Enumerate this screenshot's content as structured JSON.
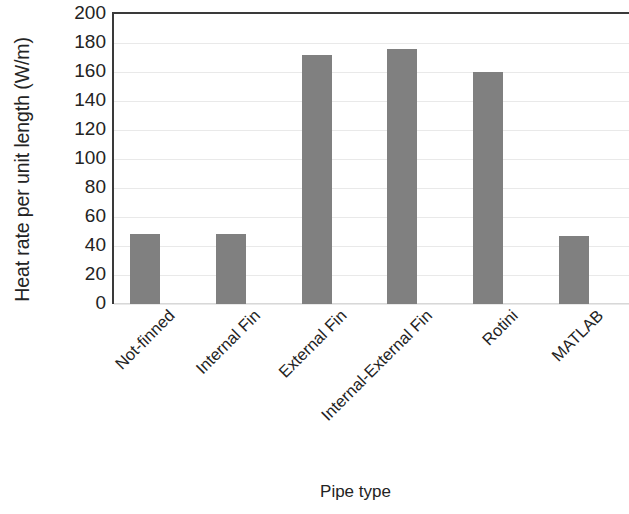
{
  "chart_data": {
    "type": "bar",
    "title": "",
    "xlabel": "Pipe type",
    "ylabel": "Heat rate per unit length (W/m)",
    "categories": [
      "Not-finned",
      "Internal Fin",
      "External Fin",
      "Internal-External Fin",
      "Rotini",
      "MATLAB"
    ],
    "values": [
      48,
      48,
      172,
      176,
      160,
      47
    ],
    "ylim": [
      0,
      200
    ],
    "ytick_labels": [
      "200",
      "180",
      "160",
      "140",
      "120",
      "100",
      "80",
      "60",
      "40",
      "20",
      "0"
    ],
    "ytick_values": [
      200,
      180,
      160,
      140,
      120,
      100,
      80,
      60,
      40,
      20,
      0
    ],
    "ytick_step": 20,
    "grid": true,
    "grid_orientation": "horizontal",
    "legend": false,
    "bar_color": "#808080",
    "axis_color": "#3a3a3a",
    "grid_color": "#e9e9e9",
    "background_color": "#ffffff",
    "xtick_label_rotation": -45
  }
}
